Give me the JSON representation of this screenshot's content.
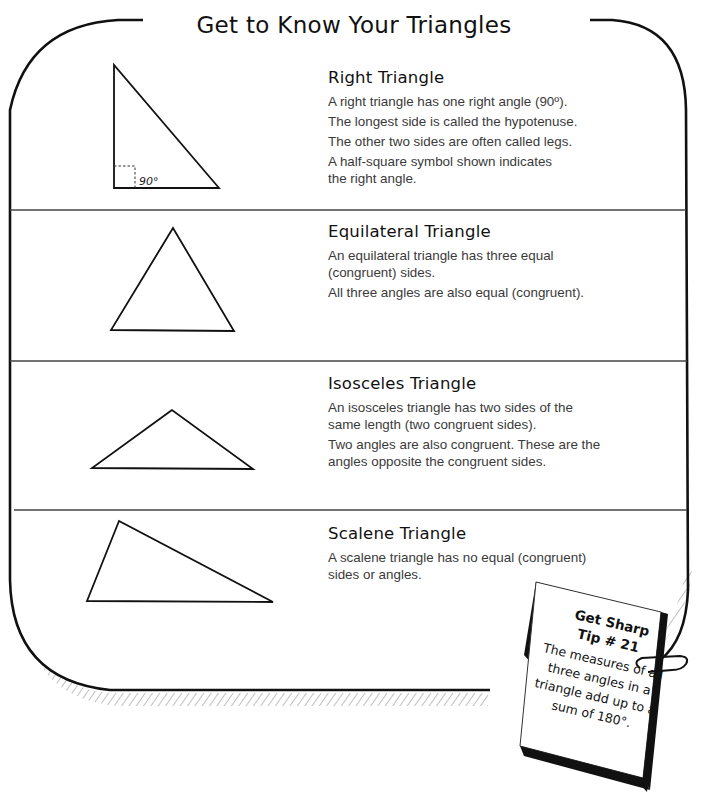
{
  "page": {
    "title": "Get to Know Your Triangles"
  },
  "sections": [
    {
      "heading": "Right Triangle",
      "lines": [
        "A right triangle has one right angle (90º).",
        "The longest side is called the hypotenuse.",
        "The other two sides are often called legs.",
        "A half-square symbol shown indicates the right angle."
      ],
      "figure": {
        "shape": "right-triangle-icon",
        "angle_label": "90°"
      }
    },
    {
      "heading": "Equilateral Triangle",
      "lines": [
        "An equilateral triangle has three equal (congruent) sides.",
        "All three angles are also equal (congruent)."
      ],
      "figure": {
        "shape": "equilateral-triangle-icon"
      }
    },
    {
      "heading": "Isosceles Triangle",
      "lines": [
        "An isosceles triangle has two sides of the same length (two congruent sides).",
        "Two angles are also congruent. These are the angles opposite the congruent sides."
      ],
      "figure": {
        "shape": "isosceles-triangle-icon"
      }
    },
    {
      "heading": "Scalene Triangle",
      "lines": [
        "A scalene triangle has no equal (congruent) sides or angles."
      ],
      "figure": {
        "shape": "scalene-triangle-icon"
      }
    }
  ],
  "tip_card": {
    "heading_line1": "Get Sharp",
    "heading_line2": "Tip # 21",
    "body": "The measures of all three angles in a triangle add up to a sum of 180°."
  },
  "colors": {
    "ink": "#111111",
    "body_text": "#3a3a3a",
    "background": "#ffffff"
  }
}
